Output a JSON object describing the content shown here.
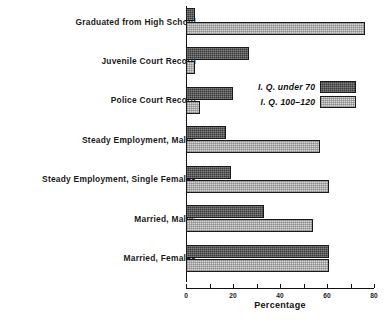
{
  "chart_data": {
    "type": "bar",
    "orientation": "horizontal",
    "title": "",
    "xlabel": "Percentage",
    "ylabel": "",
    "xlim": [
      0,
      80
    ],
    "xticks": [
      0,
      20,
      40,
      60,
      80
    ],
    "xtick_labels": [
      "0",
      "20",
      "40",
      "60",
      "80"
    ],
    "grid": false,
    "legend_position": "inside-right-upper",
    "categories": [
      "Graduated from High School",
      "Juvenile Court Record",
      "Police Court Record",
      "Steady Employment, Males",
      "Steady Employment, Single Females",
      "Married, Males",
      "Married, Females"
    ],
    "series": [
      {
        "name": "I. Q. under 70",
        "fill": "dark-hatch",
        "color": "#3a3a3a",
        "values": [
          4,
          27,
          20,
          17,
          19,
          33,
          61
        ]
      },
      {
        "name": "I. Q. 100–120",
        "fill": "light-hatch",
        "color": "#d6d6d6",
        "values": [
          76,
          4,
          6,
          57,
          61,
          54,
          61
        ]
      }
    ]
  },
  "legend": {
    "items": [
      {
        "label": "I. Q. under 70",
        "swatch": "dark"
      },
      {
        "label": "I. Q. 100–120",
        "swatch": "light"
      }
    ]
  },
  "axis": {
    "x_title": "Percentage"
  }
}
